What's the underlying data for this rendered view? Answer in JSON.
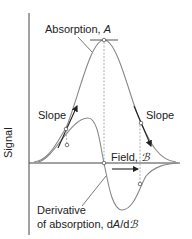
{
  "diagram": {
    "y_axis_label": "Signal",
    "absorption_label": "Absorption, ",
    "absorption_symbol": "A",
    "field_label": "Field, ",
    "field_symbol": "ℬ",
    "slope_left_label": "Slope",
    "slope_right_label": "Slope",
    "derivative_label_line1": "Derivative",
    "derivative_label_line2": "of absorption, d",
    "derivative_symbol_A": "A",
    "derivative_label_sep": "/d",
    "derivative_symbol_B": "ℬ",
    "colors": {
      "curve": "#888888",
      "axis": "#444444",
      "arrow": "#222222",
      "text": "#222222"
    }
  }
}
